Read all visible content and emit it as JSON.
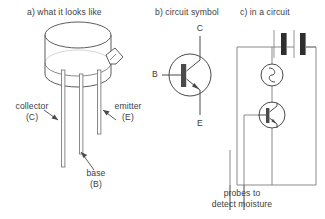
{
  "panels": {
    "a": {
      "heading": "a) what it looks like",
      "labels": {
        "collector_line1": "collector",
        "collector_line2": "(C)",
        "emitter_line1": "emitter",
        "emitter_line2": "(E)",
        "base_line1": "base",
        "base_line2": "(B)"
      }
    },
    "b": {
      "heading": "b) circuit symbol",
      "terminals": {
        "collector": "C",
        "base": "B",
        "emitter": "E"
      }
    },
    "c": {
      "heading": "c) in a circuit",
      "caption_line1": "probes to",
      "caption_line2": "detect moisture",
      "components": [
        "battery-two-cells",
        "buzzer",
        "npn-transistor",
        "moisture-probes"
      ]
    }
  },
  "colors": {
    "background": "#ffffff",
    "ink": "#3d3d3d",
    "line": "#555555",
    "wire": "#7d7d7d",
    "symbol_fill": "#2e2e2e"
  }
}
